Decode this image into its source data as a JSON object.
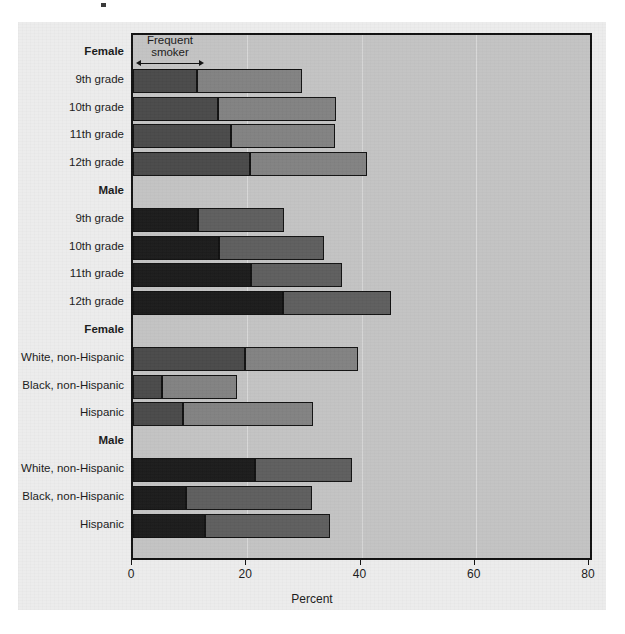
{
  "annotation": {
    "label": "Frequent\nsmoker"
  },
  "axis": {
    "xlabel": "Percent",
    "ticks": [
      "0",
      "20",
      "40",
      "60",
      "80"
    ]
  },
  "rows": [
    {
      "label": "Female",
      "type": "group",
      "sex": "female"
    },
    {
      "label": "9th grade",
      "type": "bar",
      "sex": "female",
      "frequent": 11.2,
      "total": 29.6
    },
    {
      "label": "10th grade",
      "type": "bar",
      "sex": "female",
      "frequent": 14.9,
      "total": 35.6
    },
    {
      "label": "11th grade",
      "type": "bar",
      "sex": "female",
      "frequent": 17.1,
      "total": 35.4
    },
    {
      "label": "12th grade",
      "type": "bar",
      "sex": "female",
      "frequent": 20.4,
      "total": 41.0
    },
    {
      "label": "Male",
      "type": "group",
      "sex": "male"
    },
    {
      "label": "9th grade",
      "type": "bar",
      "sex": "male",
      "frequent": 11.4,
      "total": 26.4
    },
    {
      "label": "10th grade",
      "type": "bar",
      "sex": "male",
      "frequent": 15.0,
      "total": 33.4
    },
    {
      "label": "11th grade",
      "type": "bar",
      "sex": "male",
      "frequent": 20.6,
      "total": 36.6
    },
    {
      "label": "12th grade",
      "type": "bar",
      "sex": "male",
      "frequent": 26.3,
      "total": 45.2
    },
    {
      "label": "Female",
      "type": "group",
      "sex": "female"
    },
    {
      "label": "White, non-Hispanic",
      "type": "bar",
      "sex": "female",
      "frequent": 19.6,
      "total": 39.4
    },
    {
      "label": "Black, non-Hispanic",
      "type": "bar",
      "sex": "female",
      "frequent": 5.1,
      "total": 18.2
    },
    {
      "label": "Hispanic",
      "type": "bar",
      "sex": "female",
      "frequent": 8.8,
      "total": 31.5
    },
    {
      "label": "Male",
      "type": "group",
      "sex": "male"
    },
    {
      "label": "White, non-Hispanic",
      "type": "bar",
      "sex": "male",
      "frequent": 21.4,
      "total": 38.4
    },
    {
      "label": "Black, non-Hispanic",
      "type": "bar",
      "sex": "male",
      "frequent": 9.3,
      "total": 31.4
    },
    {
      "label": "Hispanic",
      "type": "bar",
      "sex": "male",
      "frequent": 12.6,
      "total": 34.4
    }
  ],
  "colors": {
    "frequent_female": "#4a4a4a",
    "any_female": "#828282",
    "frequent_male": "#1b1b1b",
    "any_male": "#5e5e5e",
    "plot_background": "#c3c3c3",
    "panel_background": "#ececec",
    "frame": "#111111"
  },
  "chart_data": {
    "type": "bar",
    "orientation": "horizontal",
    "stacked": true,
    "title": "",
    "xlabel": "Percent",
    "ylabel": "",
    "xlim": [
      0,
      80
    ],
    "xticks": [
      0,
      20,
      40,
      60,
      80
    ],
    "grid": true,
    "legend": "none",
    "annotations": [
      "Frequent smoker"
    ],
    "categories": [
      "Female 9th grade",
      "Female 10th grade",
      "Female 11th grade",
      "Female 12th grade",
      "Male 9th grade",
      "Male 10th grade",
      "Male 11th grade",
      "Male 12th grade",
      "Female White, non-Hispanic",
      "Female Black, non-Hispanic",
      "Female Hispanic",
      "Male White, non-Hispanic",
      "Male Black, non-Hispanic",
      "Male Hispanic"
    ],
    "series": [
      {
        "name": "Frequent smoker",
        "values": [
          11.2,
          14.9,
          17.1,
          20.4,
          11.4,
          15.0,
          20.6,
          26.3,
          19.6,
          5.1,
          8.8,
          21.4,
          9.3,
          12.6
        ]
      },
      {
        "name": "Current smoker (total)",
        "values": [
          29.6,
          35.6,
          35.4,
          41.0,
          26.4,
          33.4,
          36.6,
          45.2,
          39.4,
          18.2,
          31.5,
          38.4,
          31.4,
          34.4
        ]
      }
    ]
  }
}
